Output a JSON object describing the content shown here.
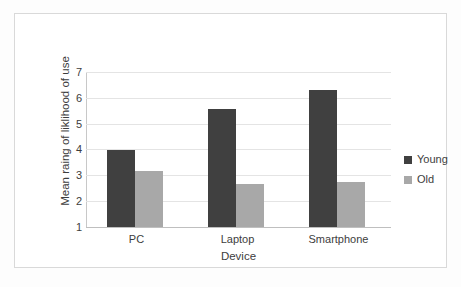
{
  "chart_data": {
    "type": "bar",
    "title": "",
    "categories": [
      "PC",
      "Laptop",
      "Smartphone"
    ],
    "series": [
      {
        "name": "Young",
        "values": [
          4.0,
          5.55,
          6.3
        ],
        "color": "#404040"
      },
      {
        "name": "Old",
        "values": [
          3.15,
          2.65,
          2.75
        ],
        "color": "#a8a8a8"
      }
    ],
    "xlabel": "Device",
    "ylabel": "Mean raing of liklihood of use",
    "ylim": [
      1,
      7
    ],
    "yticks": [
      1,
      2,
      3,
      4,
      5,
      6,
      7
    ],
    "ytick_labels": [
      "1",
      "2",
      "3",
      "4",
      "5",
      "6",
      "7"
    ],
    "grid": true,
    "grid_axis": "y",
    "legend_position": "right",
    "bar_mode": "grouped"
  },
  "axes": {
    "y_title": "Mean raing of liklihood of use",
    "x_title": "Device",
    "y_ticks": {
      "t7": "7",
      "t6": "6",
      "t5": "5",
      "t4": "4",
      "t3": "3",
      "t2": "2",
      "t1": "1"
    },
    "categories": {
      "c0": "PC",
      "c1": "Laptop",
      "c2": "Smartphone"
    }
  },
  "legend": {
    "items": [
      {
        "label": "Young",
        "color": "#404040"
      },
      {
        "label": "Old",
        "color": "#a8a8a8"
      }
    ]
  },
  "colors": {
    "young": "#404040",
    "old": "#a8a8a8",
    "gridline": "#e4e4e4",
    "frame_border": "#d9d9d9",
    "text": "#3d3d3d",
    "background": "#ffffff"
  }
}
